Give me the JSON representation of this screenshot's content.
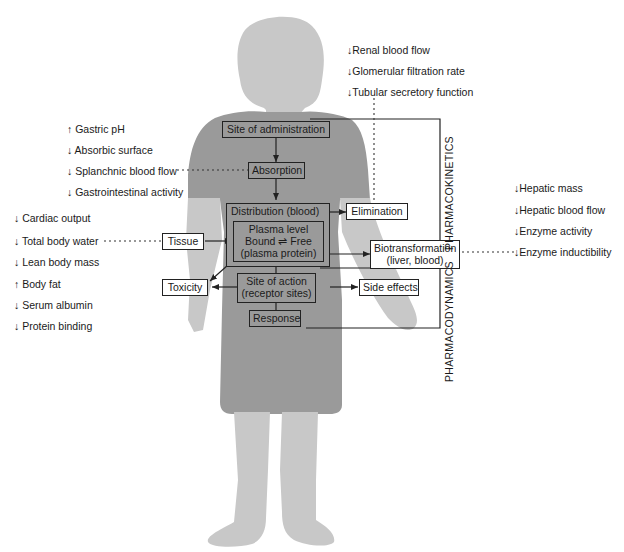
{
  "figure": {
    "colors": {
      "skin": "#c8c8c8",
      "dress": "#9a9a9a",
      "line": "#222222",
      "text": "#1a1a1a"
    },
    "flow_boxes": {
      "site_of_administration": "Site of administration",
      "absorption": "Absorption",
      "distribution": "Distribution (blood)",
      "plasma_line1": "Plasma level",
      "plasma_line2": "Bound ⇌ Free",
      "plasma_line3": "(plasma protein)",
      "site_of_action_line1": "Site of action",
      "site_of_action_line2": "(receptor sites)",
      "response": "Response",
      "tissue": "Tissue",
      "toxicity": "Toxicity",
      "elimination": "Elimination",
      "biotransformation_line1": "Biotransformation",
      "biotransformation_line2": "(liver, blood)",
      "side_effects": "Side effects"
    },
    "bracket_labels": {
      "pharmacokinetics": "PHARMACOKINETICS",
      "pharmacodynamics": "PHARMACODYNAMICS"
    },
    "absorption_factors": [
      "↑ Gastric pH",
      "↓ Absorbic surface",
      "↓ Splanchnic blood flow",
      "↓ Gastrointestinal activity"
    ],
    "distribution_factors": [
      "↓ Cardiac output",
      "↓ Total body water",
      "↓ Lean body mass",
      "↑ Body fat",
      "↓ Serum albumin",
      "↓ Protein binding"
    ],
    "elimination_factors": [
      "↓Renal blood flow",
      "↓Glomerular filtration rate",
      "↓Tubular secretory function"
    ],
    "metabolism_factors": [
      "↓Hepatic mass",
      "↓Hepatic blood flow",
      "↓Enzyme activity",
      "↓Enzyme inductibility"
    ]
  }
}
